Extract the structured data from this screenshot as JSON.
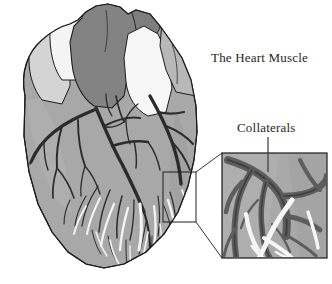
{
  "figure": {
    "kind": "anatomical-illustration",
    "width": 332,
    "height": 284,
    "background_color": "#ffffff"
  },
  "labels": {
    "title": "The Heart Muscle",
    "callout": "Collaterals"
  },
  "colors": {
    "background": "#ffffff",
    "myocardium_fill": "#a8a8a8",
    "myocardium_light": "#c9c9c9",
    "vessel_dark_gray": "#7d7d7d",
    "vessel_white": "#f2f2f2",
    "artery_line": "#2e2e2e",
    "outline": "#1c1c1c",
    "text": "#262626",
    "inset_fill": "#a8a8a8",
    "inset_border": "#1c1c1c",
    "leader_line": "#3a3a3a"
  },
  "regions": {
    "heart": {
      "name": "heart-body",
      "x": 12,
      "y": 2,
      "width": 190,
      "height": 272
    },
    "source_box": {
      "name": "magnified-source-region",
      "x": 163,
      "y": 172,
      "width": 33,
      "height": 50
    },
    "inset_box": {
      "name": "magnified-inset",
      "x": 222,
      "y": 153,
      "width": 105,
      "height": 105
    }
  },
  "leader": {
    "collaterals_line_x": 268,
    "collaterals_line_top": 137,
    "collaterals_line_bottom": 172
  }
}
